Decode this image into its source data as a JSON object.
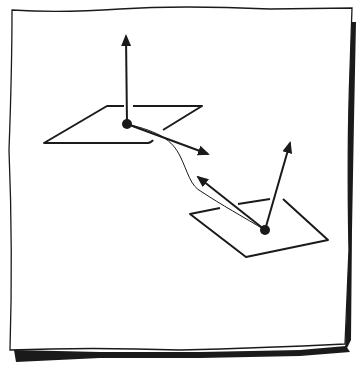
{
  "figure": {
    "stroke_color": "#1a1a1a",
    "background_color": "#ffffff",
    "paper": {
      "outline": [
        [
          12,
          10
        ],
        [
          60,
          12
        ],
        [
          120,
          9
        ],
        [
          200,
          12
        ],
        [
          270,
          8
        ],
        [
          352,
          8
        ],
        [
          350,
          60
        ],
        [
          348,
          150
        ],
        [
          349,
          250
        ],
        [
          345,
          345
        ],
        [
          260,
          348
        ],
        [
          180,
          350
        ],
        [
          90,
          346
        ],
        [
          10,
          350
        ],
        [
          12,
          250
        ],
        [
          8,
          150
        ],
        [
          12,
          60
        ]
      ],
      "shadow_right": [
        [
          350,
          20
        ],
        [
          358,
          22
        ],
        [
          356,
          200
        ],
        [
          352,
          345
        ],
        [
          346,
          352
        ],
        [
          348,
          300
        ],
        [
          349,
          150
        ]
      ],
      "shadow_bottom": [
        [
          14,
          350
        ],
        [
          90,
          355
        ],
        [
          180,
          356
        ],
        [
          260,
          354
        ],
        [
          346,
          352
        ],
        [
          345,
          360
        ],
        [
          260,
          361
        ],
        [
          180,
          362
        ],
        [
          90,
          360
        ],
        [
          16,
          362
        ]
      ]
    },
    "plane_top": {
      "points": [
        [
          107,
          106
        ],
        [
          202,
          106
        ],
        [
          160,
          132
        ],
        [
          152,
          142
        ],
        [
          44,
          143
        ]
      ],
      "gap_segments": [
        [
          [
            107,
            106
          ],
          [
            124,
            106
          ]
        ],
        [
          [
            133,
            106
          ],
          [
            202,
            106
          ]
        ],
        [
          [
            202,
            106
          ],
          [
            163,
            130
          ]
        ],
        [
          [
            152,
            141
          ],
          [
            44,
            143
          ]
        ],
        [
          [
            44,
            143
          ],
          [
            107,
            106
          ]
        ]
      ],
      "point": [
        127,
        124
      ],
      "normal_tip": [
        126,
        36
      ],
      "tangent_tip": [
        208,
        154
      ]
    },
    "plane_bottom": {
      "gap_segments": [
        [
          [
            190,
            214
          ],
          [
            220,
            208
          ]
        ],
        [
          [
            238,
            204
          ],
          [
            270,
            199
          ]
        ],
        [
          [
            283,
            199
          ],
          [
            328,
            240
          ]
        ],
        [
          [
            328,
            240
          ],
          [
            246,
            257
          ]
        ],
        [
          [
            246,
            257
          ],
          [
            190,
            214
          ]
        ]
      ],
      "point": [
        265,
        230
      ],
      "normal_tip": [
        290,
        143
      ],
      "tangent_tip": [
        196,
        176
      ]
    },
    "curve": {
      "path": "M127,124 C160,132 172,140 180,156 C188,172 190,186 202,192 C220,204 245,218 265,230"
    }
  }
}
